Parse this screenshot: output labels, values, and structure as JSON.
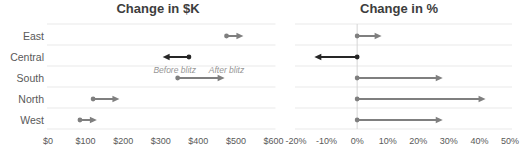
{
  "chart_data": [
    {
      "type": "arrow",
      "title": "Change in $K",
      "categories": [
        "East",
        "Central",
        "South",
        "North",
        "West"
      ],
      "x_ticks": [
        "$0",
        "$100",
        "$200",
        "$300",
        "$400",
        "$500",
        "$600"
      ],
      "x_tick_values": [
        0,
        100,
        200,
        300,
        400,
        500,
        600
      ],
      "xlim": [
        0,
        600
      ],
      "grid": "horizontal",
      "legend_position": "none",
      "series": [
        {
          "category": "East",
          "before": 475,
          "after": 520,
          "color": "#7f7f7f"
        },
        {
          "category": "Central",
          "before": 375,
          "after": 305,
          "color": "#262626"
        },
        {
          "category": "South",
          "before": 345,
          "after": 470,
          "color": "#7f7f7f"
        },
        {
          "category": "North",
          "before": 120,
          "after": 190,
          "color": "#7f7f7f"
        },
        {
          "category": "West",
          "before": 85,
          "after": 130,
          "color": "#7f7f7f"
        }
      ],
      "annotations": [
        {
          "text": "Before blitz",
          "x": 337,
          "row": "South"
        },
        {
          "text": "After blitz",
          "x": 475,
          "row": "South"
        }
      ]
    },
    {
      "type": "arrow",
      "title": "Change in %",
      "categories": [
        "East",
        "Central",
        "South",
        "North",
        "West"
      ],
      "x_ticks": [
        "-20%",
        "-10%",
        "0%",
        "10%",
        "20%",
        "30%",
        "40%",
        "50%"
      ],
      "x_tick_values": [
        -20,
        -10,
        0,
        10,
        20,
        30,
        40,
        50
      ],
      "xlim": [
        -20,
        50
      ],
      "grid": "horizontal",
      "zero_line": true,
      "legend_position": "none",
      "series": [
        {
          "category": "East",
          "before": 0,
          "after": 8,
          "color": "#7f7f7f"
        },
        {
          "category": "Central",
          "before": 0,
          "after": -14,
          "color": "#262626"
        },
        {
          "category": "South",
          "before": 0,
          "after": 28,
          "color": "#7f7f7f"
        },
        {
          "category": "North",
          "before": 0,
          "after": 42,
          "color": "#7f7f7f"
        },
        {
          "category": "West",
          "before": 0,
          "after": 28,
          "color": "#7f7f7f"
        }
      ]
    }
  ],
  "colors": {
    "arrow_gray": "#7f7f7f",
    "arrow_black": "#262626",
    "gridline": "#e9e9e9",
    "zero_line": "#d6d6d6",
    "tick_text": "#595959",
    "category_text": "#595959",
    "title_text": "#3d3d3d",
    "annotation_text": "#969696",
    "background": "#ffffff"
  }
}
